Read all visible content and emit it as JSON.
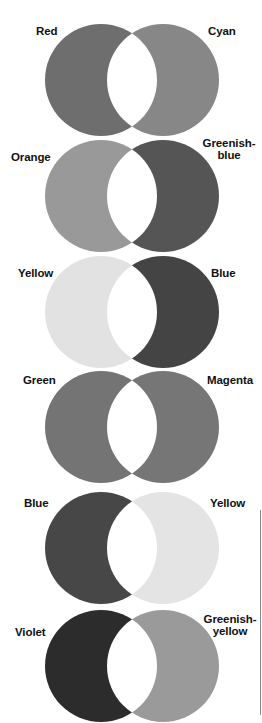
{
  "diagram": {
    "circle_radius": 56,
    "left_center_x": 101,
    "right_center_x": 163,
    "lens_color": "#ffffff",
    "pairs": [
      {
        "center_y": 80,
        "left": {
          "label": "Red",
          "fill": "#6e6e6e",
          "label_x": 36,
          "label_y": 24
        },
        "right": {
          "label": "Cyan",
          "fill": "#878787",
          "label_x": 208,
          "label_y": 24
        }
      },
      {
        "center_y": 196,
        "left": {
          "label": "Orange",
          "fill": "#999999",
          "label_x": 11,
          "label_y": 150
        },
        "right": {
          "label_line1": "Greenish-",
          "label_line2": "blue",
          "fill": "#555555",
          "label_x": 201,
          "label_y": 137
        }
      },
      {
        "center_y": 312,
        "left": {
          "label": "Yellow",
          "fill": "#e2e2e2",
          "label_x": 18,
          "label_y": 267
        },
        "right": {
          "label": "Blue",
          "fill": "#444444",
          "label_x": 211,
          "label_y": 267
        }
      },
      {
        "center_y": 427,
        "left": {
          "label": "Green",
          "fill": "#747474",
          "label_x": 23,
          "label_y": 374
        },
        "right": {
          "label": "Magenta",
          "fill": "#767676",
          "label_x": 207,
          "label_y": 374
        }
      },
      {
        "center_y": 548,
        "left": {
          "label": "Blue",
          "fill": "#474747",
          "label_x": 24,
          "label_y": 496
        },
        "right": {
          "label": "Yellow",
          "fill": "#e4e4e4",
          "label_x": 210,
          "label_y": 496
        }
      },
      {
        "center_y": 666,
        "left": {
          "label": "Violet",
          "fill": "#2c2c2c",
          "label_x": 15,
          "label_y": 624
        },
        "right": {
          "label_line1": "Greenish-",
          "label_line2": "yellow",
          "fill": "#9a9a9a",
          "label_x": 202,
          "label_y": 612
        }
      }
    ]
  }
}
